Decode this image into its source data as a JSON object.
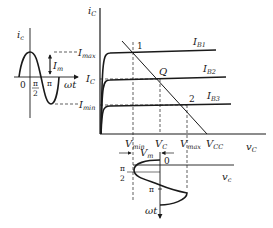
{
  "diagram": {
    "main_axes": {
      "y_label": "i",
      "y_sub": "C",
      "x_label": "v",
      "x_sub": "C"
    },
    "current_levels": [
      {
        "label": "I",
        "sub": "max"
      },
      {
        "label": "I",
        "sub": "C"
      },
      {
        "label": "I",
        "sub": "min"
      }
    ],
    "curves": [
      {
        "label": "I",
        "sub": "B1"
      },
      {
        "label": "I",
        "sub": "B2"
      },
      {
        "label": "I",
        "sub": "B3"
      }
    ],
    "points": {
      "p1": "1",
      "q": "Q",
      "p2": "2"
    },
    "voltage_levels": [
      {
        "label": "V",
        "sub": "min"
      },
      {
        "label": "V",
        "sub": "C"
      },
      {
        "label": "V",
        "sub": "max"
      },
      {
        "label": "V",
        "sub": "CC"
      }
    ],
    "left_wave": {
      "y_label": "i",
      "y_sub": "c",
      "x_label": "ωt",
      "amplitude_label": "I",
      "amplitude_sub": "m",
      "zero": "0",
      "pi_half_num": "π",
      "pi_half_den": "2",
      "pi": "π"
    },
    "bottom_wave": {
      "amplitude_label": "V",
      "amplitude_sub": "m",
      "x_label": "v",
      "x_sub": "c",
      "y_label": "ωt",
      "zero": "0",
      "pi_half_num": "π",
      "pi_half_den": "2",
      "pi": "π"
    }
  }
}
